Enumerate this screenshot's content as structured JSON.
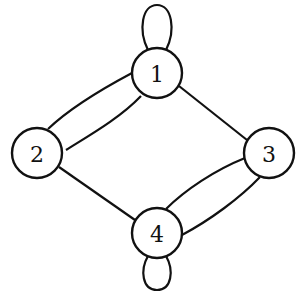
{
  "graph": {
    "nodes": [
      {
        "id": "1",
        "label": "1",
        "x": 157,
        "y": 73
      },
      {
        "id": "2",
        "label": "2",
        "x": 37,
        "y": 153
      },
      {
        "id": "3",
        "label": "3",
        "x": 269,
        "y": 153
      },
      {
        "id": "4",
        "label": "4",
        "x": 157,
        "y": 233
      }
    ],
    "edges": [
      {
        "from": "1",
        "to": "1",
        "type": "loop"
      },
      {
        "from": "1",
        "to": "2",
        "count": 2
      },
      {
        "from": "1",
        "to": "3",
        "count": 1
      },
      {
        "from": "2",
        "to": "4",
        "count": 1
      },
      {
        "from": "3",
        "to": "4",
        "count": 2
      },
      {
        "from": "4",
        "to": "4",
        "type": "loop"
      }
    ]
  }
}
